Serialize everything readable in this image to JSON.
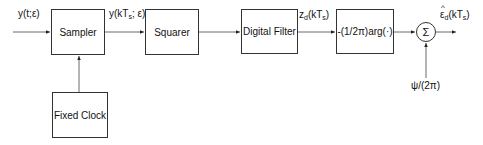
{
  "diagram": {
    "title": "",
    "input_label": "y(t;ε)",
    "blocks": [
      {
        "id": "sampler",
        "label": "Sampler"
      },
      {
        "id": "squarer",
        "label": "Squarer"
      },
      {
        "id": "digital_filter",
        "label": "Digital Filter"
      },
      {
        "id": "arg",
        "label": "-(1/2π)arg(·)"
      },
      {
        "id": "fixed_clock",
        "label": "Fixed Clock"
      }
    ],
    "summer": {
      "symbol": "Σ"
    },
    "signals": {
      "sampled": {
        "main": "y(kT",
        "sub": "s",
        "tail": "; ε)"
      },
      "filtered": {
        "main": "z",
        "sub": "d",
        "mid": "(kT",
        "sub2": "s",
        "tail": ")"
      },
      "output": {
        "hat": "^",
        "main": "ε",
        "sub": "d",
        "mid": "(kT",
        "sub2": "s",
        "tail": ")"
      },
      "offset": "ψ/(2π)"
    },
    "connections": [
      [
        "input",
        "sampler"
      ],
      [
        "fixed_clock",
        "sampler"
      ],
      [
        "sampler",
        "squarer"
      ],
      [
        "squarer",
        "digital_filter"
      ],
      [
        "digital_filter",
        "arg"
      ],
      [
        "arg",
        "summer"
      ],
      [
        "offset",
        "summer"
      ],
      [
        "summer",
        "output"
      ]
    ]
  }
}
